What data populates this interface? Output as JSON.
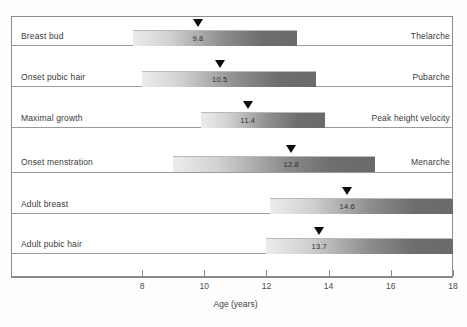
{
  "chart_data": {
    "type": "bar",
    "title": "",
    "subtitle": "",
    "xlabel": "Age (years)",
    "ylabel": "",
    "xlim": [
      6.0,
      18.0
    ],
    "grid": false,
    "legend": "none",
    "orientation": "horizontal",
    "axis_ticks": [
      8,
      10,
      12,
      14,
      16,
      18
    ],
    "categories": [
      "Breast bud",
      "Onset pubic hair",
      "Maximal growth",
      "Onset menstration",
      "Adult breast",
      "Adult pubic hair"
    ],
    "right_labels": [
      "Thelarche",
      "Pubarche",
      "Peak height velocity",
      "Menarche",
      "",
      ""
    ],
    "series": [
      {
        "name": "Age range (years)",
        "bars": [
          {
            "label": "Breast bud",
            "right_label": "Thelarche",
            "start": 7.7,
            "end": 13.0,
            "mean": 9.8,
            "mean_text": "9.8"
          },
          {
            "label": "Onset pubic hair",
            "right_label": "Pubarche",
            "start": 8.0,
            "end": 13.6,
            "mean": 10.5,
            "mean_text": "10.5"
          },
          {
            "label": "Maximal growth",
            "right_label": "Peak height velocity",
            "start": 9.9,
            "end": 13.9,
            "mean": 11.4,
            "mean_text": "11.4"
          },
          {
            "label": "Onset menstration",
            "right_label": "Menarche",
            "start": 9.0,
            "end": 15.5,
            "mean": 12.8,
            "mean_text": "12.8"
          },
          {
            "label": "Adult breast",
            "right_label": "",
            "start": 12.1,
            "end": 18.0,
            "mean": 14.6,
            "mean_text": "14.6"
          },
          {
            "label": "Adult pubic hair",
            "right_label": "",
            "start": 12.0,
            "end": 18.0,
            "mean": 13.7,
            "mean_text": "13.7"
          }
        ]
      }
    ],
    "tick_labels": [
      "8",
      "10",
      "12",
      "14",
      "16",
      "18"
    ]
  },
  "colors": {
    "frame": "#8a8a8a",
    "row_line": "#9a9a9a",
    "bar_light": "#ececec",
    "bar_dark": "#6a6a6a",
    "marker": "#0d0d0d",
    "text": "#3a3a3a",
    "background": "#ffffff"
  }
}
